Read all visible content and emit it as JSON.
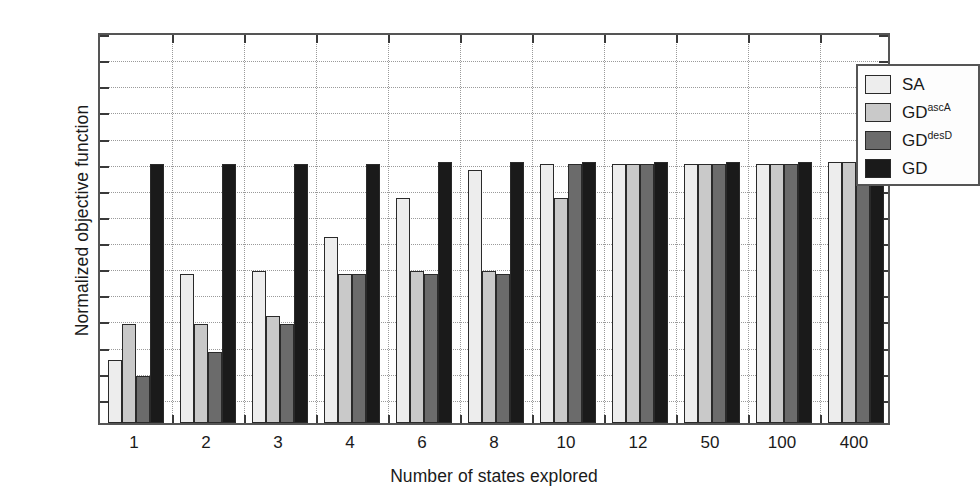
{
  "chart_data": {
    "type": "bar",
    "title": "",
    "xlabel": "Number of states explored",
    "ylabel": "Normalized objective function",
    "categories": [
      "1",
      "2",
      "3",
      "4",
      "6",
      "8",
      "10",
      "12",
      "50",
      "100",
      "400"
    ],
    "ytick_labels": [
      "0",
      "0.1",
      "0.2",
      "0.3",
      "0.4",
      "0.5",
      "0.6",
      "0.7",
      "0.8",
      "0.9",
      "1"
    ],
    "ytick_values": [
      0,
      0.1,
      0.2,
      0.3,
      0.4,
      0.5,
      0.6,
      0.7,
      0.8,
      0.9,
      1
    ],
    "ylim": [
      0,
      1.5
    ],
    "xlim_note": "categorical, 11 groups, 4 bars each",
    "grid": "dotted horizontal and vertical gridlines",
    "legend_position": "top-right inside axes",
    "series": [
      {
        "name": "SA",
        "color": "#ededed",
        "values": [
          0.24,
          0.57,
          0.58,
          0.71,
          0.86,
          0.97,
          0.99,
          0.99,
          0.99,
          0.99,
          1.0
        ]
      },
      {
        "name": "GD^ascA",
        "label_base": "GD",
        "label_sup": "ascA",
        "color": "#c9c9c9",
        "values": [
          0.38,
          0.38,
          0.41,
          0.57,
          0.58,
          0.58,
          0.86,
          0.99,
          0.99,
          0.99,
          1.0
        ]
      },
      {
        "name": "GD^desD",
        "label_base": "GD",
        "label_sup": "desD",
        "color": "#6b6b6b",
        "values": [
          0.18,
          0.27,
          0.38,
          0.57,
          0.57,
          0.57,
          0.99,
          0.99,
          0.99,
          0.99,
          0.99
        ]
      },
      {
        "name": "GD",
        "label_base": "GD",
        "label_sup": "",
        "color": "#1a1a1a",
        "values": [
          0.99,
          0.99,
          0.99,
          0.99,
          1.0,
          1.0,
          1.0,
          1.0,
          1.0,
          1.0,
          0.99
        ]
      }
    ]
  },
  "colors": {
    "axis": "#555555",
    "grid": "#9a9a9a",
    "bar_edge": "#2a2a2a",
    "background": "#ffffff",
    "text": "#1a1a1a"
  }
}
